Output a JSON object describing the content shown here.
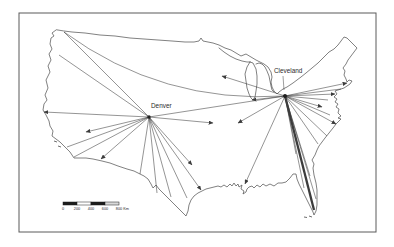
{
  "figure": {
    "type": "hub-and-spoke-flow-map",
    "region": "United States",
    "background": "#ffffff",
    "frame_color": "#5a5a5a",
    "outline_color": "#4a4a4a",
    "route_color": "#3c3c3c",
    "text_color": "#2b2b2b"
  },
  "map": {
    "outline_paths": [
      "M56,30 L52,33 54,36 51,38 50,44 52,49 49,54 51,60 48,66 50,72 46,80 48,88 45,95 47,100 44,104 43,110 46,115 49,121 50,126 53,131 52,136 56,139 60,142 64,146 67,149 70,152 72,155 74,158 79,158 86,158 93,159 102,161 110,163 118,166 127,169 134,171 140,174 144,176 148,179 151,184 153,188 156,185 159,189 163,193 167,197 171,201 176,206 180,210 184,214 186,216 188,211 189,205 191,200 194,196 198,193 202,191 206,189 210,188 214,187 218,186 221,187 224,185 227,187 230,184 232,186 234,183 236,186 238,184 239,187 242,185 241,189 244,191 243,194 246,192 247,189 249,187 252,186 254,188 257,185 260,187 263,184 266,186 270,184 274,186 278,183 282,183 286,182 290,178 293,174 296,174 297,179 299,184 302,190 305,196 308,202 311,208 313,212 314,215 316,211 317,205 317,198 317,190 316,183 314,175 313,168 314,164 312,160 315,155 317,150 319,146 322,142 325,138 329,133 333,128 336,124 339,121 341,119 338,118 341,116 338,113 339,109 336,107 338,104 335,102 337,99 334,97 337,94 335,91 338,90 341,89 344,88 347,86 350,84 352,81 349,80 347,82 346,79 344,75 345,71 343,68 346,64 348,60 351,56 354,52 357,48 354,45 350,41 347,38 344,37 341,41 338,45 334,49 329,52 324,57 318,63 312,68 306,73 301,77 297,80 293,83 290,85 287,87 283,89 279,92 277,94 274,91 272,87 271,82 272,77 271,72 268,67 264,64 260,62 256,60 251,57 246,54 241,56 236,53 231,50 225,48 219,45 213,43 208,42 203,41 201,38 199,41 194,42 185,42 172,41 158,40 144,39 130,38 115,36 100,35 85,33 72,32 64,31 Z",
      "M250,62 L247,67 245,74 246,81 247,88 249,94 251,98 253,100 255,97 256,91 257,84 257,76 256,69 253,63 250,62",
      "M256,64 L259,63 262,64 265,67 267,71 269,76 270,81 271,86 272,90 274,92",
      "M219,48 L224,52 230,56 236,59 242,61 247,62 250,62"
    ],
    "island_paths": [
      "M54,141 l3,1",
      "M58,146 l3,1",
      "M309,216 l3,1",
      "M304,217 l3,0.5"
    ],
    "hubs": [
      {
        "label": "Denver",
        "x": 149,
        "y": 117,
        "label_x": 151,
        "label_y": 108,
        "dot_r": 1.7,
        "spokes": [
          {
            "x": 64,
            "y": 32
          },
          {
            "x": 59,
            "y": 55
          },
          {
            "x": 44,
            "y": 112,
            "arrow": true
          },
          {
            "x": 86,
            "y": 132,
            "arrow": true
          },
          {
            "x": 67,
            "y": 147
          },
          {
            "x": 74,
            "y": 157
          },
          {
            "x": 101,
            "y": 159,
            "arrow": true
          },
          {
            "x": 140,
            "y": 174
          },
          {
            "x": 157,
            "y": 193
          },
          {
            "x": 171,
            "y": 197
          },
          {
            "x": 187,
            "y": 198
          },
          {
            "x": 201,
            "y": 190,
            "arrow": true
          },
          {
            "x": 192,
            "y": 165,
            "arrow": true
          },
          {
            "x": 213,
            "y": 123,
            "arrow": true
          },
          {
            "x": 285,
            "y": 96
          }
        ]
      },
      {
        "label": "Cleveland",
        "x": 285,
        "y": 96,
        "label_x": 274,
        "label_y": 73,
        "dot_r": 2.0,
        "leader": {
          "x1": 283,
          "y1": 76,
          "x2": 284,
          "y2": 90
        },
        "spokes": [
          {
            "x": 64,
            "y": 32,
            "curve": [
              162,
              104
            ]
          },
          {
            "x": 222,
            "y": 76,
            "arrow": true
          },
          {
            "x": 252,
            "y": 100,
            "arrow": true
          },
          {
            "x": 238,
            "y": 123,
            "arrow": true
          },
          {
            "x": 347,
            "y": 83,
            "arrow": true
          },
          {
            "x": 341,
            "y": 89
          },
          {
            "x": 335,
            "y": 94,
            "arrow": true
          },
          {
            "x": 328,
            "y": 100
          },
          {
            "x": 322,
            "y": 107,
            "arrow": true
          },
          {
            "x": 330,
            "y": 115
          },
          {
            "x": 336,
            "y": 124,
            "arrow": true
          },
          {
            "x": 327,
            "y": 136
          },
          {
            "x": 318,
            "y": 144
          },
          {
            "x": 296,
            "y": 154
          },
          {
            "x": 245,
            "y": 184,
            "arrow": true
          },
          {
            "x": 310,
            "y": 176
          },
          {
            "x": 304,
            "y": 188
          },
          {
            "x": 316,
            "y": 199
          },
          {
            "x": 314,
            "y": 210,
            "thick": true
          }
        ]
      }
    ],
    "frame": {
      "x": 19,
      "y": 13,
      "width": 357,
      "height": 219
    },
    "scalebar": {
      "x": 63,
      "y": 202,
      "height": 3,
      "segment_width": 14,
      "fills": [
        "#1c1c1c",
        "#ffffff",
        "#1c1c1c",
        "#d9d9d9"
      ],
      "labels": [
        "0",
        "200",
        "400",
        "600",
        "800"
      ],
      "unit": "Km"
    }
  }
}
